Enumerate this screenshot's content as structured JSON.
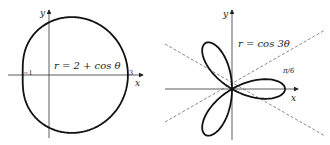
{
  "figure": {
    "left": {
      "equation": "r = 2 + cos θ",
      "x_axis_label": "x",
      "y_axis_label": "y",
      "tick_left": "−1",
      "tick_right": "3",
      "curve": "limacon",
      "stroke_color": "#111111"
    },
    "right": {
      "equation": "r = cos 3θ",
      "x_axis_label": "x",
      "y_axis_label": "y",
      "angle_label": "π/6",
      "curve": "three-leaved rose",
      "stroke_color": "#111111",
      "guide_line_style": "dashed"
    }
  }
}
